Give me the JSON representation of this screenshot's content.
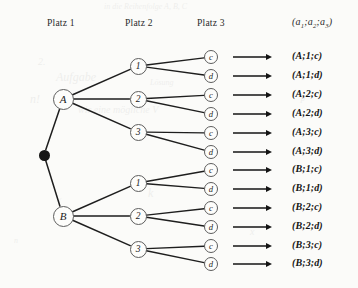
{
  "figure": {
    "type": "probability-tree-diagram",
    "language": "de",
    "headers": [
      {
        "id": "platz-1",
        "label": "Platz 1",
        "x": 47,
        "y": 23
      },
      {
        "id": "platz-2",
        "label": "Platz 2",
        "x": 125,
        "y": 23
      },
      {
        "id": "platz-3",
        "label": "Platz 3",
        "x": 197,
        "y": 23
      }
    ],
    "outcome_header": {
      "id": "outcome-tuple-header",
      "open": "(",
      "a1": "a",
      "s1": "1",
      "sep1": ";",
      "a2": "a",
      "s2": "2",
      "sep2": ";",
      "a3": "a",
      "s3": "3",
      "close": ")",
      "x": 292,
      "y": 23
    },
    "root": {
      "id": "root-node",
      "x": 44,
      "y": 155,
      "color": "#151515"
    },
    "level1": [
      {
        "id": "node-A",
        "label": "A",
        "x": 63,
        "y": 99
      },
      {
        "id": "node-B",
        "label": "B",
        "x": 63,
        "y": 216
      }
    ],
    "level2": [
      {
        "id": "node-A-1",
        "label": "1",
        "parent": "node-A",
        "x": 138,
        "y": 66
      },
      {
        "id": "node-A-2",
        "label": "2",
        "parent": "node-A",
        "x": 138,
        "y": 99
      },
      {
        "id": "node-A-3",
        "label": "3",
        "parent": "node-A",
        "x": 138,
        "y": 132
      },
      {
        "id": "node-B-1",
        "label": "1",
        "parent": "node-B",
        "x": 138,
        "y": 183
      },
      {
        "id": "node-B-2",
        "label": "2",
        "parent": "node-B",
        "x": 138,
        "y": 216
      },
      {
        "id": "node-B-3",
        "label": "3",
        "parent": "node-B",
        "x": 138,
        "y": 249
      }
    ],
    "leaves": [
      {
        "id": "leaf-A-1-c",
        "label": "c",
        "parent": "node-A-1",
        "x": 211,
        "y": 57
      },
      {
        "id": "leaf-A-1-d",
        "label": "d",
        "parent": "node-A-1",
        "x": 211,
        "y": 76
      },
      {
        "id": "leaf-A-2-c",
        "label": "c",
        "parent": "node-A-2",
        "x": 211,
        "y": 95
      },
      {
        "id": "leaf-A-2-d",
        "label": "d",
        "parent": "node-A-2",
        "x": 211,
        "y": 114
      },
      {
        "id": "leaf-A-3-c",
        "label": "c",
        "parent": "node-A-3",
        "x": 211,
        "y": 133
      },
      {
        "id": "leaf-A-3-d",
        "label": "d",
        "parent": "node-A-3",
        "x": 211,
        "y": 152
      },
      {
        "id": "leaf-B-1-c",
        "label": "c",
        "parent": "node-B-1",
        "x": 211,
        "y": 170
      },
      {
        "id": "leaf-B-1-d",
        "label": "d",
        "parent": "node-B-1",
        "x": 211,
        "y": 189
      },
      {
        "id": "leaf-B-2-c",
        "label": "c",
        "parent": "node-B-2",
        "x": 211,
        "y": 208
      },
      {
        "id": "leaf-B-2-d",
        "label": "d",
        "parent": "node-B-2",
        "x": 211,
        "y": 227
      },
      {
        "id": "leaf-B-3-c",
        "label": "c",
        "parent": "node-B-3",
        "x": 211,
        "y": 246
      },
      {
        "id": "leaf-B-3-d",
        "label": "d",
        "parent": "node-B-3",
        "x": 211,
        "y": 264
      }
    ],
    "arrows": {
      "x_start": 233,
      "x_end": 272,
      "glyph": "long-right-arrow",
      "rows": [
        57,
        76,
        95,
        114,
        133,
        152,
        170,
        189,
        208,
        227,
        246,
        264
      ]
    },
    "outcomes": [
      {
        "id": "outcome-1",
        "label": "(A;1;c)",
        "x": 292,
        "y": 57
      },
      {
        "id": "outcome-2",
        "label": "(A;1;d)",
        "x": 292,
        "y": 76
      },
      {
        "id": "outcome-3",
        "label": "(A;2;c)",
        "x": 292,
        "y": 95
      },
      {
        "id": "outcome-4",
        "label": "(A;2;d)",
        "x": 292,
        "y": 114
      },
      {
        "id": "outcome-5",
        "label": "(A;3;c)",
        "x": 292,
        "y": 133
      },
      {
        "id": "outcome-6",
        "label": "(A;3;d)",
        "x": 292,
        "y": 152
      },
      {
        "id": "outcome-7",
        "label": "(B;1;c)",
        "x": 292,
        "y": 170
      },
      {
        "id": "outcome-8",
        "label": "(B;1;d)",
        "x": 292,
        "y": 189
      },
      {
        "id": "outcome-9",
        "label": "(B;2;c)",
        "x": 292,
        "y": 208
      },
      {
        "id": "outcome-10",
        "label": "(B;2;d)",
        "x": 292,
        "y": 227
      },
      {
        "id": "outcome-11",
        "label": "(B;3;c)",
        "x": 292,
        "y": 246
      },
      {
        "id": "outcome-12",
        "label": "(B;3;d)",
        "x": 292,
        "y": 264
      }
    ],
    "colors": {
      "paper": "#fbfbf9",
      "ink": "#141414",
      "node_stroke": "#5d5d5d",
      "edge": "#1e1e1e",
      "header_text": "#2b2b2b"
    },
    "bleed_text": [
      {
        "t": "in die Reihenfolge A, B, C",
        "x": 104,
        "y": 2
      },
      {
        "t": "2.",
        "x": 38,
        "y": 56
      },
      {
        "t": "Aufgabe",
        "x": 56,
        "y": 70
      },
      {
        "t": "Lösung",
        "x": 150,
        "y": 78
      },
      {
        "t": "wir eine mögliche V",
        "x": 78,
        "y": 104
      },
      {
        "t": "n!",
        "x": 30,
        "y": 92
      },
      {
        "t": "P",
        "x": 300,
        "y": 96
      },
      {
        "t": "(",
        "x": 58,
        "y": 196
      },
      {
        "t": "k",
        "x": 148,
        "y": 186
      },
      {
        "t": "n",
        "x": 14,
        "y": 236
      },
      {
        "t": "x",
        "x": 250,
        "y": 226
      }
    ]
  }
}
